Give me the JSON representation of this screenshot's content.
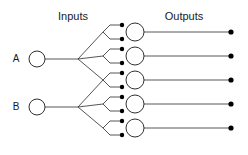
{
  "figure": {
    "type": "neural-network-fanout-diagram",
    "width": 248,
    "height": 155,
    "background": "#ffffff",
    "line_color": "#2b2b2b",
    "text_color": "#1a1a1a",
    "dot_color": "#000000"
  },
  "headers": {
    "inputs_label": "Inputs",
    "outputs_label": "Outputs",
    "inputs_x": 73,
    "outputs_x": 184,
    "label_y": 20
  },
  "input_nodes": [
    {
      "label": "A",
      "label_x": 16,
      "label_y": 62,
      "cx": 37,
      "cy": 59,
      "r": 8
    },
    {
      "label": "B",
      "label_x": 16,
      "label_y": 110,
      "cx": 37,
      "cy": 107,
      "r": 8
    }
  ],
  "fan_points": [
    {
      "name": "fan-a",
      "x": 78,
      "y": 59
    },
    {
      "name": "fan-b",
      "x": 78,
      "y": 107
    }
  ],
  "sub_fan_points": [
    {
      "name": "subfan-1",
      "x": 103,
      "y": 32,
      "from": "fan-a"
    },
    {
      "name": "subfan-2",
      "x": 103,
      "y": 56,
      "from": "fan-a"
    },
    {
      "name": "subfan-3",
      "x": 103,
      "y": 80,
      "from": "fan-a"
    },
    {
      "name": "subfan-4",
      "x": 103,
      "y": 80,
      "from": "fan-b"
    },
    {
      "name": "subfan-5",
      "x": 103,
      "y": 104,
      "from": "fan-b"
    },
    {
      "name": "subfan-6",
      "x": 103,
      "y": 128,
      "from": "fan-b"
    }
  ],
  "hidden_nodes": [
    {
      "index": 1,
      "cx": 135,
      "cy": 32,
      "r": 9,
      "in_dot_x": 122,
      "in_dot_top_y": 25,
      "in_dot_bot_y": 39
    },
    {
      "index": 2,
      "cx": 135,
      "cy": 56,
      "r": 9,
      "in_dot_x": 122,
      "in_dot_top_y": 49,
      "in_dot_bot_y": 63
    },
    {
      "index": 3,
      "cx": 135,
      "cy": 80,
      "r": 9,
      "in_dot_x": 122,
      "in_dot_top_y": 73,
      "in_dot_bot_y": 87
    },
    {
      "index": 4,
      "cx": 135,
      "cy": 104,
      "r": 9,
      "in_dot_x": 122,
      "in_dot_top_y": 97,
      "in_dot_bot_y": 111
    },
    {
      "index": 5,
      "cx": 135,
      "cy": 128,
      "r": 9,
      "in_dot_x": 122,
      "in_dot_top_y": 121,
      "in_dot_bot_y": 135
    }
  ],
  "output_terminals": [
    {
      "index": 1,
      "x": 231,
      "y": 32,
      "r": 2.6,
      "line_from_x": 144
    },
    {
      "index": 2,
      "x": 231,
      "y": 56,
      "r": 2.6,
      "line_from_x": 144
    },
    {
      "index": 3,
      "x": 231,
      "y": 80,
      "r": 2.6,
      "line_from_x": 144
    },
    {
      "index": 4,
      "x": 231,
      "y": 104,
      "r": 2.6,
      "line_from_x": 144
    },
    {
      "index": 5,
      "x": 231,
      "y": 128,
      "r": 2.6,
      "line_from_x": 144
    }
  ],
  "counts": {
    "inputs": 2,
    "hidden": 5,
    "outputs": 5
  }
}
